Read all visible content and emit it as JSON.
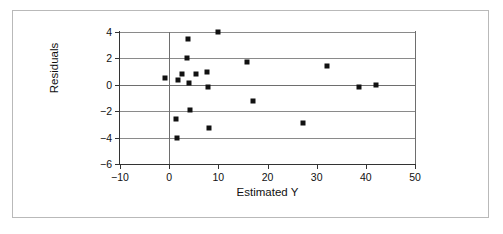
{
  "figure": {
    "frame_color": "#b9b9b9",
    "background": "#ffffff",
    "marker_color": "#111111",
    "grid_color": "#8a8a8a",
    "axis_color": "#333333"
  },
  "axes": {
    "x_title": "Estimated Y",
    "y_title": "Residuals",
    "x_ticks": [
      "-10",
      "0",
      "10",
      "20",
      "30",
      "40",
      "50"
    ],
    "y_ticks": [
      "4",
      "2",
      "0",
      "-2",
      "-4",
      "-6"
    ]
  },
  "chart_data": {
    "type": "scatter",
    "title": "",
    "xlabel": "Estimated Y",
    "ylabel": "Residuals",
    "xlim": [
      -10,
      50
    ],
    "ylim": [
      -6,
      4
    ],
    "xticks": [
      -10,
      0,
      10,
      20,
      30,
      40,
      50
    ],
    "yticks": [
      -6,
      -4,
      -2,
      0,
      2,
      4
    ],
    "grid": "horizontal",
    "legend": "none",
    "zero_reference_line_x": 0,
    "marker": "square",
    "series": [
      {
        "name": "Residuals",
        "points": [
          {
            "x": -0.8,
            "y": 0.55
          },
          {
            "x": 1.3,
            "y": -2.6
          },
          {
            "x": 1.6,
            "y": -4.0
          },
          {
            "x": 1.8,
            "y": 0.35
          },
          {
            "x": 2.6,
            "y": 0.85
          },
          {
            "x": 3.6,
            "y": 2.05
          },
          {
            "x": 3.8,
            "y": 3.45
          },
          {
            "x": 4.1,
            "y": 0.1
          },
          {
            "x": 4.3,
            "y": -1.9
          },
          {
            "x": 5.4,
            "y": 0.85
          },
          {
            "x": 7.7,
            "y": 1.0
          },
          {
            "x": 7.9,
            "y": -0.15
          },
          {
            "x": 8.0,
            "y": -3.25
          },
          {
            "x": 10.0,
            "y": 4.0
          },
          {
            "x": 15.8,
            "y": 1.7
          },
          {
            "x": 17.0,
            "y": -1.25
          },
          {
            "x": 27.3,
            "y": -2.9
          },
          {
            "x": 32.2,
            "y": 1.4
          },
          {
            "x": 38.7,
            "y": -0.15
          },
          {
            "x": 42.1,
            "y": 0.0
          }
        ]
      }
    ]
  }
}
